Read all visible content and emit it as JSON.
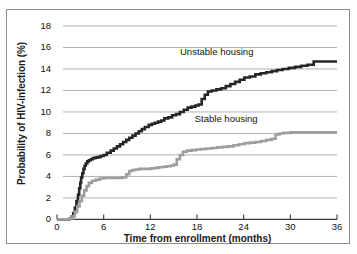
{
  "figure": {
    "background_color": "#fdfdfd",
    "frame_color": "#8d8d8d"
  },
  "chart_data": {
    "type": "line",
    "title": "",
    "subtitle": "",
    "xlabel": "Time from enrollment (months)",
    "ylabel": "Probability of HIV-infection (%)",
    "xlim": [
      0,
      36
    ],
    "ylim": [
      0,
      18
    ],
    "xticks": [
      0,
      6,
      12,
      18,
      24,
      30,
      36
    ],
    "yticks": [
      0,
      2,
      4,
      6,
      8,
      10,
      12,
      14,
      16,
      18
    ],
    "xtick_labels": [
      "0",
      "6",
      "12",
      "18",
      "24",
      "30",
      "36"
    ],
    "ytick_labels": [
      "0",
      "2",
      "4",
      "6",
      "8",
      "10",
      "12",
      "14",
      "16",
      "18"
    ],
    "grid": true,
    "grid_axis": "y",
    "grid_color": "#a9a9a9",
    "legend_position": "inline-annotations",
    "annotations": [
      {
        "name": "unstable-housing-label",
        "text": "Unstable housing",
        "x": 22.5,
        "y": 15.6
      },
      {
        "name": "stable-housing-label",
        "text": "Stable housing",
        "x": 23.5,
        "y": 9.3
      }
    ],
    "series": [
      {
        "name": "Unstable housing",
        "color": "#262626",
        "line_width": 2.6,
        "step": "post",
        "x": [
          0,
          1.6,
          1.9,
          2.1,
          2.3,
          2.5,
          2.7,
          2.85,
          3.0,
          3.1,
          3.25,
          3.4,
          3.55,
          3.7,
          3.9,
          4.1,
          4.35,
          4.6,
          4.9,
          5.2,
          5.6,
          6.0,
          6.4,
          6.9,
          7.3,
          7.7,
          8.1,
          8.5,
          8.9,
          9.3,
          9.7,
          10.1,
          10.5,
          10.9,
          11.3,
          11.8,
          12.2,
          12.6,
          13.0,
          13.4,
          13.8,
          14.3,
          14.8,
          15.3,
          15.8,
          16.3,
          16.8,
          17.3,
          17.8,
          18.2,
          18.6,
          19.0,
          19.4,
          19.9,
          20.5,
          21.1,
          21.7,
          22.3,
          22.9,
          23.5,
          24.1,
          24.8,
          25.5,
          26.2,
          26.9,
          27.6,
          28.3,
          29.0,
          29.8,
          30.6,
          31.4,
          32.2,
          33.0,
          33.6,
          34.2,
          36.0
        ],
        "y": [
          0,
          0.1,
          0.3,
          0.6,
          1.1,
          1.7,
          2.3,
          2.9,
          3.4,
          3.9,
          4.3,
          4.7,
          5.0,
          5.2,
          5.4,
          5.5,
          5.6,
          5.7,
          5.75,
          5.8,
          5.9,
          6.0,
          6.2,
          6.4,
          6.6,
          6.8,
          7.0,
          7.2,
          7.4,
          7.6,
          7.8,
          8.0,
          8.2,
          8.4,
          8.6,
          8.8,
          8.9,
          9.0,
          9.1,
          9.2,
          9.4,
          9.5,
          9.7,
          9.8,
          10.0,
          10.2,
          10.4,
          10.5,
          10.6,
          10.7,
          11.2,
          11.6,
          11.9,
          12.0,
          12.1,
          12.2,
          12.4,
          12.6,
          12.8,
          13.0,
          13.2,
          13.3,
          13.5,
          13.6,
          13.7,
          13.8,
          13.9,
          14.0,
          14.1,
          14.2,
          14.3,
          14.4,
          14.7,
          14.7,
          14.7,
          14.7
        ],
        "final_value": 14.7
      },
      {
        "name": "Stable housing",
        "color": "#9e9e9e",
        "line_width": 2.6,
        "step": "post",
        "x": [
          0,
          1.6,
          2.0,
          2.3,
          2.6,
          2.9,
          3.2,
          3.5,
          3.8,
          4.1,
          4.5,
          5.0,
          5.5,
          6.0,
          6.6,
          7.2,
          7.8,
          8.4,
          8.9,
          9.3,
          9.7,
          10.1,
          10.6,
          11.1,
          11.6,
          12.1,
          12.6,
          13.1,
          13.6,
          14.1,
          14.6,
          15.0,
          15.4,
          15.8,
          16.2,
          16.7,
          17.3,
          17.9,
          18.5,
          19.2,
          19.9,
          20.6,
          21.3,
          22.0,
          22.7,
          23.4,
          24.1,
          24.8,
          25.5,
          26.2,
          26.9,
          27.6,
          28.1,
          28.6,
          29.1,
          30.0,
          31.0,
          36.0
        ],
        "y": [
          0,
          0.1,
          0.3,
          0.7,
          1.2,
          1.7,
          2.2,
          2.7,
          3.1,
          3.4,
          3.6,
          3.7,
          3.8,
          3.85,
          3.85,
          3.85,
          3.85,
          3.9,
          4.2,
          4.5,
          4.6,
          4.65,
          4.7,
          4.7,
          4.7,
          4.75,
          4.8,
          4.85,
          4.9,
          4.95,
          5.0,
          5.1,
          5.6,
          6.0,
          6.3,
          6.4,
          6.45,
          6.5,
          6.55,
          6.6,
          6.65,
          6.7,
          6.75,
          6.8,
          6.9,
          7.0,
          7.1,
          7.15,
          7.2,
          7.3,
          7.4,
          7.5,
          7.9,
          8.0,
          8.05,
          8.1,
          8.1,
          8.1
        ],
        "final_value": 8.1
      }
    ]
  }
}
